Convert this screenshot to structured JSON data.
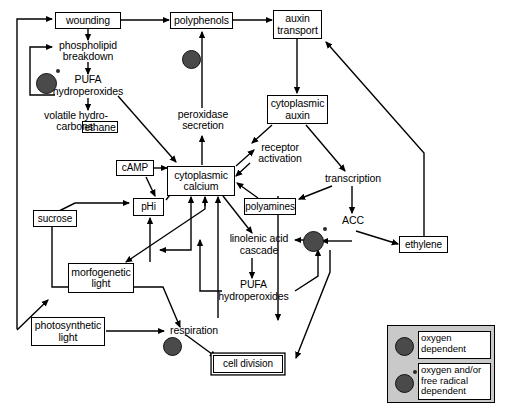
{
  "diagram": {
    "nodes": {
      "wounding": "wounding",
      "polyphenols": "polyphenols",
      "auxin_transport": "auxin\ntransport",
      "phospholipid_breakdown": "phospholipid\nbreakdown",
      "pufa_hydroperoxides_top": "PUFA\nhydroperoxides",
      "volatile_hydrocarbons": "volatile hydro-\ncarbons:",
      "ethane": "ethane",
      "peroxidase_secretion": "peroxidase\nsecretion",
      "cytoplasmic_auxin": "cytoplasmic\nauxin",
      "camp": "cAMP",
      "cytoplasmic_calcium": "cytoplasmic\ncalcium",
      "receptor_activation": "receptor\nactivation",
      "transcription": "transcription",
      "phi": "pHi",
      "polyamines": "polyamines",
      "acc": "ACC",
      "ethylene": "ethylene",
      "sucrose": "sucrose",
      "linolenic_acid_cascade": "linolenic acid\ncascade",
      "morfogenetic_light": "morfogenetic\nlight",
      "pufa_hydroperoxides_bottom": "PUFA\nhydroperoxides",
      "photosynthetic_light": "photosynthetic\nlight",
      "respiration": "respiration",
      "cell_division": "cell division"
    },
    "legend": {
      "oxygen_dependent": "oxygen\ndependent",
      "oxygen_free_radical": "oxygen and/or\nfree radical\ndependent"
    },
    "colors": {
      "line": "#000000",
      "dot_fill": "#4a4a4a",
      "legend_bg": "#c9c9c9",
      "background": "#ffffff"
    },
    "markers": [
      {
        "name": "oxygen-dot-pufa-top",
        "type": "oxygen and/or free radical dependent"
      },
      {
        "name": "oxygen-dot-peroxidase",
        "type": "oxygen dependent"
      },
      {
        "name": "oxygen-dot-linolenic",
        "type": "oxygen and/or free radical dependent"
      },
      {
        "name": "oxygen-dot-respiration",
        "type": "oxygen dependent"
      }
    ]
  }
}
